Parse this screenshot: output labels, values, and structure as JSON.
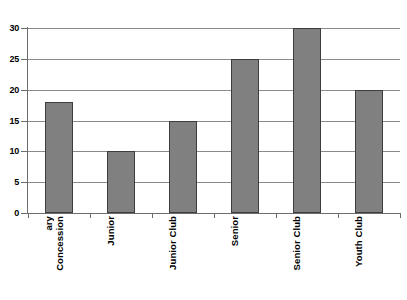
{
  "chart_data": {
    "type": "bar",
    "title": "",
    "subtitle": "",
    "xlabel": "",
    "ylabel": "",
    "categories": [
      "Concessionary",
      "Junior",
      "Junior Club",
      "Senior",
      "Senior Club",
      "Youth Club"
    ],
    "category_label_lines": [
      [
        "Concession",
        "ary"
      ],
      [
        "Junior"
      ],
      [
        "Junior Club"
      ],
      [
        "Senior"
      ],
      [
        "Senior Club"
      ],
      [
        "Youth Club"
      ]
    ],
    "values": [
      18,
      10,
      15,
      25,
      30,
      20
    ],
    "ylim": [
      0,
      30
    ],
    "ytick_values": [
      0,
      5,
      10,
      15,
      20,
      25,
      30
    ],
    "ytick_labels": [
      "0",
      "5",
      "10",
      "15",
      "20",
      "25",
      "30"
    ],
    "grid": true,
    "grid_axis": "y",
    "legend": false,
    "legend_position": "none",
    "bar_color": "#808080",
    "bar_edge_color": "#3d3d3d",
    "grid_color": "#8a8a8a",
    "axis_color": "#6d6d6d",
    "background_color": "#ffffff",
    "label_rotation": 90
  }
}
